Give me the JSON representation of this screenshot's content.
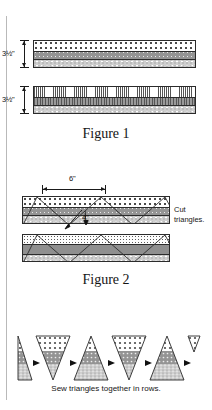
{
  "page": {
    "background": "#ffffff",
    "ink": "#1a1a1a"
  },
  "figure1": {
    "caption": "Figure 1",
    "dimension_labels": [
      "3½\"",
      "3½\""
    ],
    "strips": [
      {
        "index": 1,
        "height_label": "3½\"",
        "bands": [
          {
            "name": "large-open-dot-fabric",
            "texture": "dots-large",
            "color": "#ffffff"
          },
          {
            "name": "grey-dotted-fabric",
            "texture": "grey-dot",
            "color": "#949494"
          },
          {
            "name": "light-speckled-fabric",
            "texture": "speckle",
            "color": "#cfcfcf"
          }
        ]
      },
      {
        "index": 2,
        "height_label": "3½\"",
        "bands": [
          {
            "name": "fine-stripe-light-fabric",
            "texture": "vertical-stripe-light",
            "color": "#fafafa"
          },
          {
            "name": "grey-stripe-fabric",
            "texture": "vertical-stripe",
            "color": "#8c8c8c"
          },
          {
            "name": "light-speckled-fabric",
            "texture": "speckle",
            "color": "#cfcfcf"
          }
        ]
      }
    ]
  },
  "figure2": {
    "caption": "Figure 2",
    "width_label": "6\"",
    "inner_label": "4\"",
    "note": "Cut triangles.",
    "strips": [
      {
        "index": 1,
        "bands": [
          {
            "name": "large-open-dot-fabric",
            "texture": "dots-large",
            "color": "#ffffff"
          },
          {
            "name": "grey-dotted-fabric",
            "texture": "grey-dot",
            "color": "#949494"
          },
          {
            "name": "light-speckled-fabric",
            "texture": "speckle",
            "color": "#cfcfcf"
          }
        ],
        "cut_lines": "zigzag"
      },
      {
        "index": 2,
        "bands": [
          {
            "name": "small-dot-fabric",
            "texture": "dots-small",
            "color": "#fdfdfd"
          },
          {
            "name": "solid-grey-fabric",
            "texture": "grey",
            "color": "#8f8f8f"
          },
          {
            "name": "light-speckled-fabric",
            "texture": "speckle",
            "color": "#cfcfcf"
          }
        ],
        "cut_lines": "zigzag"
      }
    ]
  },
  "figure3": {
    "caption": "Sew triangles together in rows.",
    "triangles": [
      {
        "orientation": "up",
        "partial": true
      },
      {
        "orientation": "down",
        "partial": false
      },
      {
        "orientation": "up",
        "partial": false
      },
      {
        "orientation": "down",
        "partial": false
      },
      {
        "orientation": "up",
        "partial": false
      },
      {
        "orientation": "down",
        "partial": true
      }
    ],
    "seam_marker": "arrow-right"
  }
}
